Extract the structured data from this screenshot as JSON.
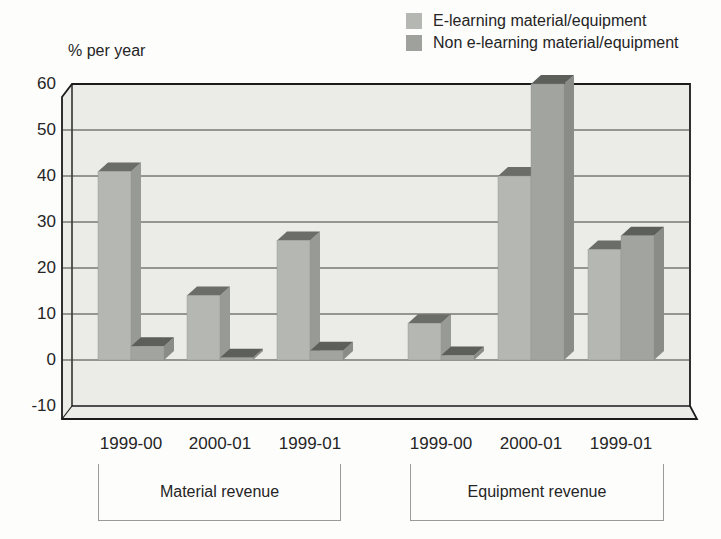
{
  "legend": {
    "items": [
      {
        "label": "E-learning material/equipment",
        "color": "#b5b7b3"
      },
      {
        "label": "Non e-learning material/equipment",
        "color": "#9fa19d"
      }
    ]
  },
  "chart_data": {
    "type": "bar",
    "ylabel": "% per year",
    "y_axis": {
      "min": -10,
      "max": 60,
      "step": 10,
      "tick_labels": [
        60,
        50,
        40,
        30,
        20,
        10,
        0,
        -10
      ],
      "grid": true
    },
    "categories": [
      "1999-00",
      "2000-01",
      "1999-01",
      "1999-00",
      "2000-01",
      "1999-01"
    ],
    "series": [
      {
        "name": "E-learning material/equipment",
        "values": [
          41,
          14,
          26,
          8,
          40,
          24
        ],
        "front_color": "#b5b7b3",
        "side_color": "#989a96",
        "top_color": "#6b6d69"
      },
      {
        "name": "Non e-learning material/equipment",
        "values": [
          3,
          0.5,
          2,
          1,
          60,
          27
        ],
        "front_color": "#a2a4a0",
        "side_color": "#8a8c88",
        "top_color": "#5d5f5b"
      }
    ],
    "group_labels": [
      {
        "label": "Material revenue",
        "category_indexes": [
          0,
          1,
          2
        ]
      },
      {
        "label": "Equipment revenue",
        "category_indexes": [
          3,
          4,
          5
        ]
      }
    ],
    "style": {
      "plot_background": "#ebebe8",
      "frame_color": "#1b1b1b",
      "gridline_color": "#3f3f3f"
    }
  }
}
